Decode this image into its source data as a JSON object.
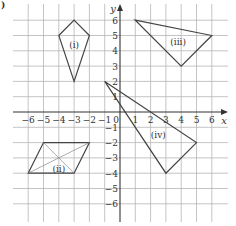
{
  "figure": {
    "corner_label": ")",
    "axes": {
      "x_label": "x",
      "y_label": "y",
      "x_min": -6,
      "x_max": 6,
      "y_min": -6,
      "y_max": 6,
      "x_ticks": [
        "-6",
        "-5",
        "-4",
        "-3",
        "-2",
        "-1",
        "0",
        "1",
        "2",
        "3",
        "4",
        "5",
        "6"
      ],
      "y_ticks": [
        "-6",
        "-5",
        "-4",
        "-3",
        "-2",
        "-1",
        "1",
        "2",
        "3",
        "4",
        "5",
        "6"
      ],
      "grid": true
    },
    "colors": {
      "grid": "#b5b5b5",
      "axis": "#333333",
      "shape": "#444444",
      "diagonal": "#888888"
    },
    "shapes": [
      {
        "label": "(i)",
        "type": "kite",
        "vertices": [
          [
            -3,
            6
          ],
          [
            -2,
            5
          ],
          [
            -3,
            2
          ],
          [
            -4,
            5
          ]
        ],
        "label_pos": [
          -3,
          4.4
        ]
      },
      {
        "label": "(ii)",
        "type": "parallelogram",
        "vertices": [
          [
            -5,
            -2
          ],
          [
            -2,
            -2
          ],
          [
            -3,
            -4
          ],
          [
            -6,
            -4
          ]
        ],
        "diagonals": true,
        "label_pos": [
          -4,
          -3.7
        ]
      },
      {
        "label": "(iii)",
        "type": "triangle",
        "vertices": [
          [
            1,
            6
          ],
          [
            6,
            5
          ],
          [
            4,
            3
          ]
        ],
        "label_pos": [
          3.8,
          4.6
        ]
      },
      {
        "label": "(iv)",
        "type": "triangle",
        "vertices": [
          [
            -1,
            2
          ],
          [
            5,
            -2
          ],
          [
            3,
            -4
          ]
        ],
        "label_pos": [
          2.5,
          -1.5
        ]
      }
    ]
  }
}
